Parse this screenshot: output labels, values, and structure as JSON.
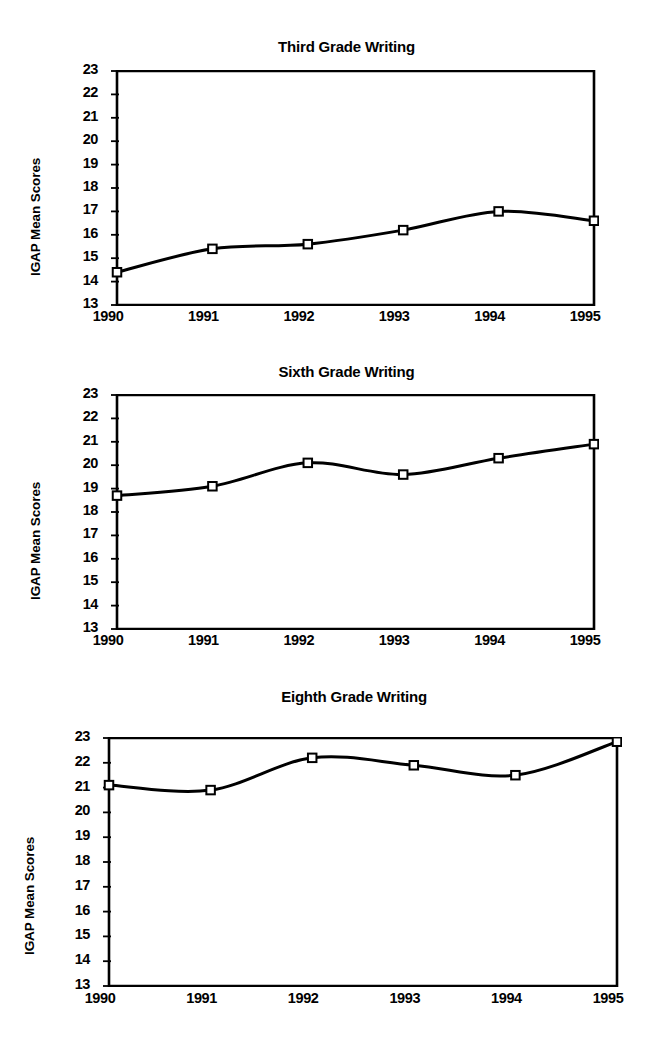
{
  "figure": {
    "axis_title": "IGAP Mean Scores",
    "y_ticks": [
      "23",
      "22",
      "21",
      "20",
      "19",
      "18",
      "17",
      "16",
      "15",
      "14",
      "13"
    ],
    "x_ticks": [
      "1990",
      "1991",
      "1992",
      "1993",
      "1994",
      "1995"
    ],
    "line_color": "#000000",
    "marker_fill": "#ffffff",
    "marker_stroke": "#000000",
    "frame_color": "#000000",
    "background": "#ffffff"
  },
  "chart_data": [
    {
      "type": "line",
      "title": "Third Grade Writing",
      "xlabel": "",
      "ylabel": "IGAP Mean Scores",
      "categories": [
        "1990",
        "1991",
        "1992",
        "1993",
        "1994",
        "1995"
      ],
      "x": [
        1990,
        1991,
        1992,
        1993,
        1994,
        1995
      ],
      "values": [
        14.4,
        15.4,
        15.6,
        16.2,
        17.0,
        16.6
      ],
      "ylim": [
        13,
        23
      ],
      "ytick_step": 1,
      "grid": false,
      "legend": "none",
      "marker": "open-square",
      "smoothing": "spline"
    },
    {
      "type": "line",
      "title": "Sixth Grade Writing",
      "xlabel": "",
      "ylabel": "IGAP Mean Scores",
      "categories": [
        "1990",
        "1991",
        "1992",
        "1993",
        "1994",
        "1995"
      ],
      "x": [
        1990,
        1991,
        1992,
        1993,
        1994,
        1995
      ],
      "values": [
        18.7,
        19.1,
        20.1,
        19.6,
        20.3,
        20.9
      ],
      "ylim": [
        13,
        23
      ],
      "ytick_step": 1,
      "grid": false,
      "legend": "none",
      "marker": "open-square",
      "smoothing": "spline"
    },
    {
      "type": "line",
      "title": "Eighth Grade Writing",
      "xlabel": "",
      "ylabel": "IGAP Mean Scores",
      "categories": [
        "1990",
        "1991",
        "1992",
        "1993",
        "1994",
        "1995"
      ],
      "x": [
        1990,
        1991,
        1992,
        1993,
        1994,
        1995
      ],
      "values": [
        21.1,
        20.9,
        22.2,
        21.9,
        21.5,
        22.85
      ],
      "ylim": [
        13,
        23
      ],
      "ytick_step": 1,
      "grid": false,
      "legend": "none",
      "marker": "open-square",
      "smoothing": "spline"
    }
  ],
  "layout": [
    {
      "title_top": 38,
      "title_left": 108,
      "title_width": 477,
      "plot_left": 108,
      "plot_top": 70,
      "plot_width": 477,
      "plot_height": 234,
      "xlabel_top": 308,
      "ylabel_left": 28,
      "ylabel_bottom": 276
    },
    {
      "title_top": 363,
      "title_left": 108,
      "title_width": 477,
      "plot_left": 108,
      "plot_top": 394,
      "plot_width": 477,
      "plot_height": 234,
      "xlabel_top": 632,
      "ylabel_left": 28,
      "ylabel_bottom": 600
    },
    {
      "title_top": 688,
      "title_left": 100,
      "title_width": 508,
      "plot_left": 100,
      "plot_top": 737,
      "plot_width": 508,
      "plot_height": 248,
      "xlabel_top": 990,
      "ylabel_left": 22,
      "ylabel_bottom": 955
    }
  ]
}
